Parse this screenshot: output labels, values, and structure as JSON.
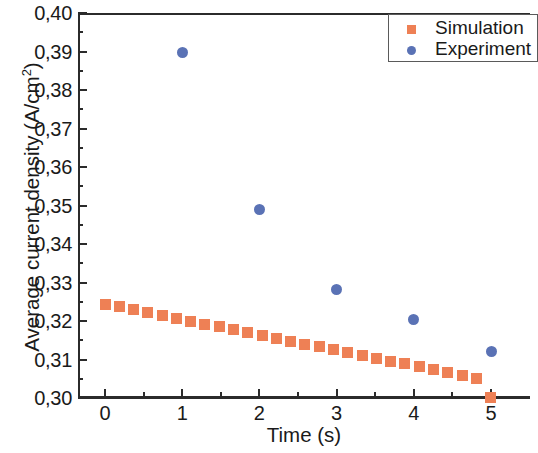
{
  "chart_data": {
    "type": "scatter",
    "title": "",
    "xlabel": "Time (s)",
    "ylabel": "Average current density (A/cm2)",
    "ylabel_base": "Average current density (A/cm",
    "ylabel_sup": "2",
    "ylabel_tail": ")",
    "xlim": [
      -0.35,
      5.5
    ],
    "ylim": [
      0.3,
      0.4
    ],
    "grid": false,
    "legend_position": "top-right",
    "decimal_separator": ",",
    "x_ticks": [
      0,
      1,
      2,
      3,
      4,
      5
    ],
    "x_tick_labels": [
      "0",
      "1",
      "2",
      "3",
      "4",
      "5"
    ],
    "x_minor_ticks": [
      0.5,
      1.5,
      2.5,
      3.5,
      4.5
    ],
    "y_ticks": [
      0.3,
      0.31,
      0.32,
      0.33,
      0.34,
      0.35,
      0.36,
      0.37,
      0.38,
      0.39,
      0.4
    ],
    "y_tick_labels": [
      "0,30",
      "0,31",
      "0,32",
      "0,33",
      "0,34",
      "0,35",
      "0,36",
      "0,37",
      "0,38",
      "0,39",
      "0,40"
    ],
    "y_minor_ticks": [
      0.305,
      0.315,
      0.325,
      0.335,
      0.345,
      0.355,
      0.365,
      0.375,
      0.385,
      0.395
    ],
    "series": [
      {
        "name": "Simulation",
        "marker": "square",
        "color": "#EE8055",
        "x": [
          0.0,
          0.185,
          0.37,
          0.555,
          0.74,
          0.925,
          1.11,
          1.295,
          1.48,
          1.665,
          1.85,
          2.035,
          2.22,
          2.405,
          2.59,
          2.775,
          2.96,
          3.145,
          3.33,
          3.515,
          3.7,
          3.885,
          4.07,
          4.255,
          4.44,
          4.625,
          4.81,
          4.995
        ],
        "y": [
          0.3242,
          0.3237,
          0.3229,
          0.3222,
          0.3215,
          0.3207,
          0.32,
          0.3192,
          0.3185,
          0.3177,
          0.317,
          0.3163,
          0.3155,
          0.3148,
          0.314,
          0.3133,
          0.3126,
          0.3118,
          0.3111,
          0.3103,
          0.3096,
          0.3089,
          0.3081,
          0.3074,
          0.3066,
          0.3059,
          0.3051,
          0.3002
        ]
      },
      {
        "name": "Experiment",
        "marker": "circle",
        "color": "#5A72B5",
        "x": [
          1,
          2,
          3,
          4,
          5
        ],
        "y": [
          0.3898,
          0.349,
          0.3283,
          0.3203,
          0.3122
        ]
      }
    ]
  },
  "legend": {
    "entries": [
      {
        "label": "Simulation",
        "marker": "square",
        "color": "#EE8055"
      },
      {
        "label": "Experiment",
        "marker": "circle",
        "color": "#5A72B5"
      }
    ]
  },
  "colors": {
    "simulation": "#EE8055",
    "experiment": "#5A72B5",
    "axis": "#2b2b2b",
    "legend_border": "#5a5a5a",
    "background": "#ffffff"
  }
}
